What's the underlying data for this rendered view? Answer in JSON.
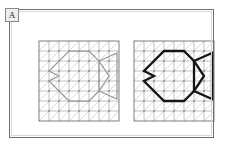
{
  "figure": {
    "panel_label": "A",
    "background_color": "#ffffff",
    "frame_color": "#6f6f6f",
    "panel_count": 2
  },
  "grid": {
    "columns": 8,
    "rows": 8,
    "cell_size_px": 10,
    "diagonal_direction": "up-right",
    "line_color": "#8d8d8d",
    "diagonal_color": "#bdbdbd",
    "border_color": "#707070",
    "node_color": "#6a6a6a",
    "show_nodes": true
  },
  "panels": [
    {
      "name": "left-panel",
      "role": "input-faint-outline",
      "shape_name": "fish",
      "stroke_color": "#9a9a9a",
      "stroke_width_px": 1.25,
      "emphasis": "faint"
    },
    {
      "name": "right-panel",
      "role": "output-bold-outline",
      "shape_name": "fish",
      "stroke_color": "#151515",
      "stroke_width_px": 2.3,
      "emphasis": "bold"
    }
  ],
  "shape_data": {
    "type": "polyline-on-lattice",
    "shape_name": "fish",
    "closed": true,
    "units": "grid-cells",
    "grid_extent": [
      8,
      8
    ],
    "body_points": [
      [
        3,
        1
      ],
      [
        5,
        1
      ],
      [
        6,
        2
      ],
      [
        6,
        5
      ],
      [
        5,
        6
      ],
      [
        3,
        6
      ],
      [
        1,
        4
      ],
      [
        2,
        3.5
      ],
      [
        1,
        3
      ]
    ],
    "tail_points": [
      [
        6,
        2
      ],
      [
        8,
        1
      ],
      [
        8,
        6
      ],
      [
        6,
        5
      ],
      [
        7,
        3.5
      ],
      [
        6,
        2
      ]
    ],
    "mouth_notch": [
      [
        1,
        3
      ],
      [
        2,
        3.5
      ],
      [
        1,
        4
      ]
    ]
  }
}
